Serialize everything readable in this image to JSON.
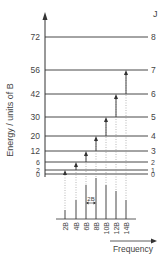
{
  "diagram": {
    "y_axis_label": "Energy / units of B",
    "x_axis_label": "Frequency",
    "j_header": "J",
    "spacing_label": "2B",
    "colors": {
      "line": "#333333",
      "text": "#444444",
      "dotted": "#999999",
      "spectrum": "#666666"
    },
    "levels": [
      {
        "J": "0",
        "energy": "0",
        "y": 174
      },
      {
        "J": "1",
        "energy": "2",
        "y": 170
      },
      {
        "J": "2",
        "energy": "6",
        "y": 162
      },
      {
        "J": "3",
        "energy": "12",
        "y": 151
      },
      {
        "J": "4",
        "energy": "20",
        "y": 136
      },
      {
        "J": "5",
        "energy": "30",
        "y": 117
      },
      {
        "J": "6",
        "energy": "42",
        "y": 94
      },
      {
        "J": "7",
        "energy": "56",
        "y": 70
      },
      {
        "J": "8",
        "energy": "72",
        "y": 37
      }
    ],
    "transitions": [
      {
        "from": 0,
        "to": 1,
        "x": 65
      },
      {
        "from": 1,
        "to": 2,
        "x": 76
      },
      {
        "from": 2,
        "to": 3,
        "x": 86
      },
      {
        "from": 3,
        "to": 4,
        "x": 96
      },
      {
        "from": 4,
        "to": 5,
        "x": 106
      },
      {
        "from": 5,
        "to": 6,
        "x": 116
      },
      {
        "from": 6,
        "to": 7,
        "x": 126
      }
    ],
    "spectrum": [
      {
        "label": "2B",
        "x": 65,
        "top": 210
      },
      {
        "label": "4B",
        "x": 76,
        "top": 200
      },
      {
        "label": "6B",
        "x": 86,
        "top": 185
      },
      {
        "label": "8B",
        "x": 96,
        "top": 178
      },
      {
        "label": "10B",
        "x": 106,
        "top": 185
      },
      {
        "label": "12B",
        "x": 116,
        "top": 191
      },
      {
        "label": "14B",
        "x": 126,
        "top": 200
      }
    ]
  }
}
